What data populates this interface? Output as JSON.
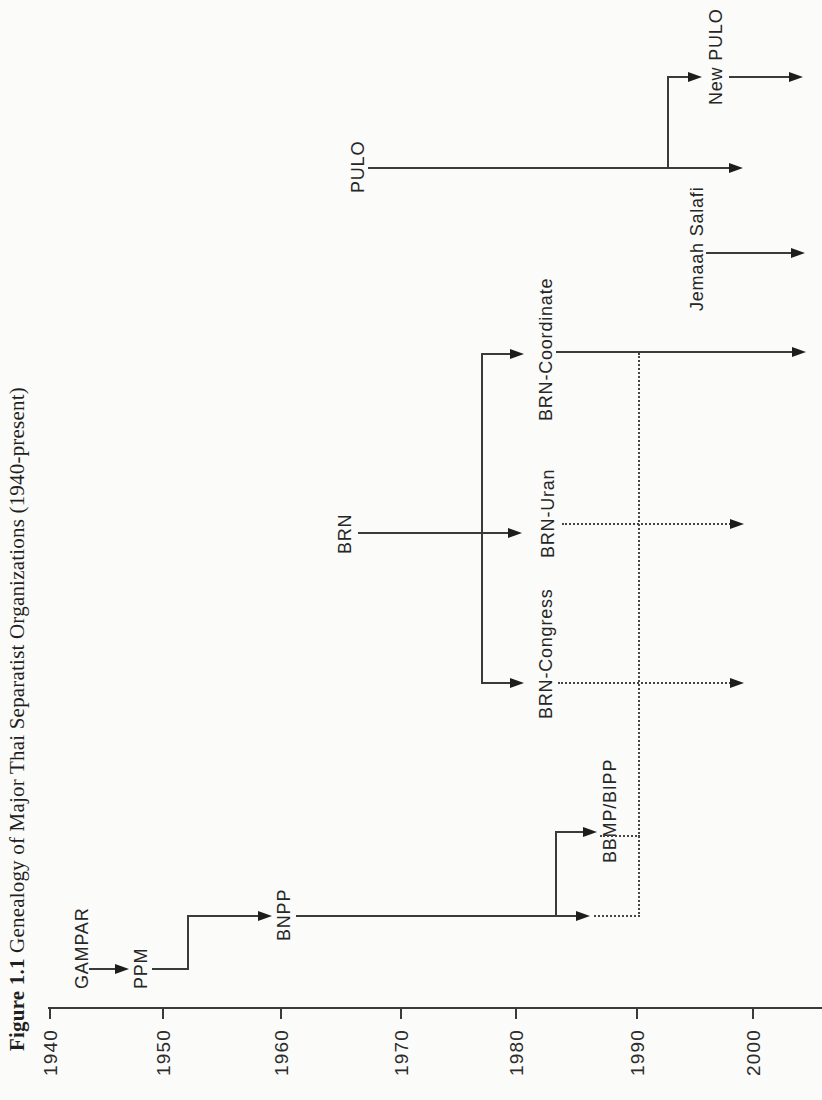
{
  "figure": {
    "number": "Figure 1.1",
    "caption": "Genealogy of Major Thai Separatist Organizations (1940-present)"
  },
  "timeline": {
    "years": [
      "1940",
      "1950",
      "1960",
      "1970",
      "1980",
      "1990",
      "2000"
    ],
    "range_note": "1940-present"
  },
  "organizations": {
    "gampar": "GAMPAR",
    "ppm": "PPM",
    "bnpp": "BNPP",
    "bbmp_bipp": "BBMP/BIPP",
    "brn": "BRN",
    "brn_congress": "BRN-Congress",
    "brn_uran": "BRN-Uran",
    "brn_coordinate": "BRN-Coordinate",
    "pulo": "PULO",
    "new_pulo": "New PULO",
    "jemaah_salafi": "Jemaah Salafi"
  },
  "genealogy": [
    {
      "from": "GAMPAR",
      "to": "PPM",
      "link": "solid-arrow"
    },
    {
      "from": "PPM",
      "to": "BNPP",
      "link": "solid-elbow-arrow"
    },
    {
      "from": "BNPP",
      "to": "BBMP/BIPP",
      "link": "solid-elbow-arrow"
    },
    {
      "from": "BNPP",
      "to": "merge-line-1990",
      "link": "dotted"
    },
    {
      "from": "BBMP/BIPP",
      "to": "merge-line-1990",
      "link": "dotted"
    },
    {
      "from": "merge-line-1990",
      "to": "BRN-Coordinate",
      "link": "dotted"
    },
    {
      "from": "BRN",
      "to": "BRN-Congress",
      "link": "solid-fork-arrow"
    },
    {
      "from": "BRN",
      "to": "BRN-Uran",
      "link": "solid-fork-arrow"
    },
    {
      "from": "BRN",
      "to": "BRN-Coordinate",
      "link": "solid-fork-arrow"
    },
    {
      "from": "BRN-Congress",
      "to": "present",
      "link": "dotted-arrow"
    },
    {
      "from": "BRN-Uran",
      "to": "present",
      "link": "dotted-arrow"
    },
    {
      "from": "BRN-Coordinate",
      "to": "present",
      "link": "solid-arrow"
    },
    {
      "from": "PULO",
      "to": "New PULO",
      "link": "solid-elbow-arrow"
    },
    {
      "from": "PULO",
      "to": "present",
      "link": "solid-arrow"
    },
    {
      "from": "New PULO",
      "to": "present",
      "link": "solid-arrow"
    },
    {
      "from": "Jemaah Salafi",
      "to": "present",
      "link": "solid-arrow"
    }
  ],
  "colors": {
    "paper": "#fbfbf9",
    "ink": "#3a3a3a",
    "arrowhead": "#1d1d1d",
    "text": "#262626"
  }
}
